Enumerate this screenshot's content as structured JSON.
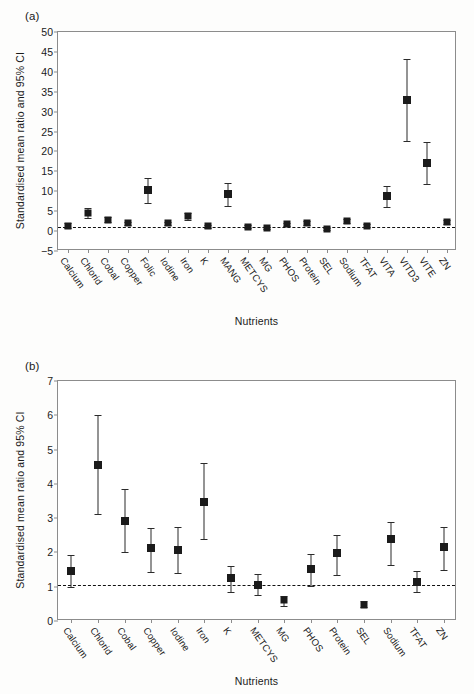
{
  "figure": {
    "panels": [
      "a",
      "b"
    ]
  },
  "panel_a": {
    "tag": "(a)",
    "ylabel": "Standardised mean ratio and 95% CI",
    "xlabel": "Nutrients"
  },
  "panel_b": {
    "tag": "(b)",
    "ylabel": "Standardised mean ratio and 95% CI",
    "xlabel": "Nutrients"
  },
  "chart_data": [
    {
      "type": "scatter",
      "panel": "a",
      "title": "",
      "xlabel": "Nutrients",
      "ylabel": "Standardised mean ratio and 95% CI",
      "ylim": [
        -5,
        50
      ],
      "yticks": [
        -5,
        0,
        5,
        10,
        15,
        20,
        25,
        30,
        35,
        40,
        45,
        50
      ],
      "grid": false,
      "legend": "none",
      "reference_line": 1,
      "categories": [
        "Calcium",
        "Chlorid",
        "Cobal",
        "Copper",
        "Folic",
        "Iodine",
        "Iron",
        "K",
        "MANG",
        "METCYS",
        "MG",
        "PHOS",
        "Protein",
        "SEL",
        "Sodium",
        "TFAT",
        "VITA",
        "VITD3",
        "VITE",
        "ZN"
      ],
      "values": [
        1.4,
        4.6,
        2.9,
        2.0,
        10.2,
        2.0,
        3.7,
        1.2,
        9.3,
        1.1,
        0.7,
        1.7,
        2.0,
        0.5,
        2.5,
        1.4,
        8.8,
        33.0,
        17.2,
        2.3
      ],
      "ci_lower": [
        0.8,
        3.4,
        2.2,
        1.6,
        7.1,
        1.6,
        2.9,
        0.8,
        6.3,
        0.7,
        0.4,
        1.3,
        1.5,
        0.2,
        2.0,
        1.0,
        6.1,
        22.7,
        11.9,
        1.8
      ],
      "ci_upper": [
        2.0,
        5.7,
        3.6,
        2.4,
        13.4,
        2.4,
        4.5,
        1.6,
        12.1,
        1.5,
        1.0,
        2.1,
        2.5,
        0.9,
        3.0,
        1.8,
        11.4,
        43.3,
        22.4,
        2.9
      ]
    },
    {
      "type": "scatter",
      "panel": "b",
      "title": "",
      "xlabel": "Nutrients",
      "ylabel": "Standardised mean ratio and 95% CI",
      "ylim": [
        0,
        7
      ],
      "yticks": [
        0,
        1,
        2,
        3,
        4,
        5,
        6,
        7
      ],
      "grid": false,
      "legend": "none",
      "reference_line": 1.05,
      "categories": [
        "Calcium",
        "Chlorid",
        "Cobal",
        "Copper",
        "Iodine",
        "Iron",
        "K",
        "METCYS",
        "MG",
        "PHOS",
        "Protein",
        "SEL",
        "Sodium",
        "TFAT",
        "ZN"
      ],
      "values": [
        1.45,
        4.55,
        2.92,
        2.12,
        2.08,
        3.48,
        1.24,
        1.05,
        0.6,
        1.51,
        1.98,
        0.48,
        2.39,
        1.15,
        2.16
      ],
      "ci_lower": [
        1.0,
        3.12,
        2.0,
        1.43,
        1.4,
        2.38,
        0.85,
        0.75,
        0.45,
        1.02,
        1.35,
        0.4,
        1.63,
        0.84,
        1.49
      ],
      "ci_upper": [
        1.92,
        6.0,
        3.84,
        2.72,
        2.75,
        4.6,
        1.6,
        1.38,
        0.72,
        1.95,
        2.5,
        0.57,
        2.9,
        1.47,
        2.74
      ]
    }
  ]
}
